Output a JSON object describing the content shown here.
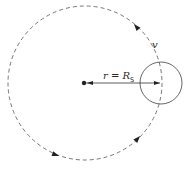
{
  "diagram": {
    "colors": {
      "stroke": "#555555",
      "arrow": "#222222",
      "text": "#2a2a2a",
      "background": "#ffffff"
    },
    "orbit": {
      "cx": 85,
      "cy": 83,
      "r": 77,
      "style": "dashed",
      "direction": "counter-clockwise"
    },
    "body": {
      "cx": 161,
      "cy": 83,
      "r": 21
    },
    "center_point": {
      "cx": 84,
      "cy": 83
    },
    "radius_label": {
      "italic": "r",
      "equals": " = ",
      "symbol": "R",
      "subscript": "S"
    },
    "velocity_label": "v",
    "arrowheads": [
      {
        "x": 133,
        "y": 24,
        "angle": -140
      },
      {
        "x": 58,
        "y": 156,
        "angle": 20
      },
      {
        "x": 139,
        "y": 137,
        "angle": -40
      }
    ]
  }
}
